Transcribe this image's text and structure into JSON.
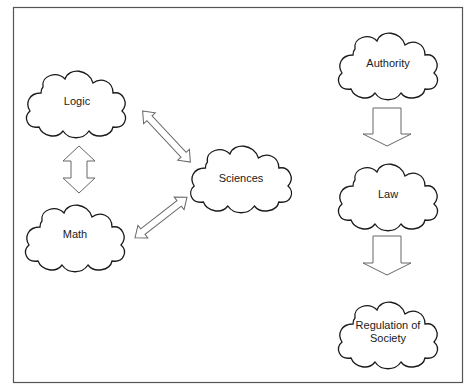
{
  "diagram": {
    "frame": {
      "x": 13,
      "y": 7,
      "width": 449,
      "height": 375,
      "stroke": "#555555"
    },
    "colors": {
      "cloud_stroke": "#1a1a1a",
      "arrow_stroke": "#666666",
      "fill": "#ffffff",
      "text": "#1a1a1a"
    },
    "nodes": [
      {
        "id": "logic",
        "label": "Logic",
        "cx": 76,
        "cy": 101,
        "w": 110,
        "h": 77
      },
      {
        "id": "math",
        "label": "Math",
        "cx": 75,
        "cy": 235,
        "w": 110,
        "h": 76
      },
      {
        "id": "sciences",
        "label": "Sciences",
        "cx": 241,
        "cy": 176,
        "w": 112,
        "h": 76
      },
      {
        "id": "authority",
        "label": "Authority",
        "cx": 388,
        "cy": 63,
        "w": 110,
        "h": 76
      },
      {
        "id": "law",
        "label": "Law",
        "cx": 388,
        "cy": 194,
        "w": 110,
        "h": 77
      },
      {
        "id": "regulation",
        "label_lines": [
          "Regulation of",
          "Society"
        ],
        "cx": 388,
        "cy": 332,
        "w": 110,
        "h": 76
      }
    ],
    "edges": [
      {
        "from": "logic",
        "to": "math",
        "type": "double-arrow",
        "direction": "vertical"
      },
      {
        "from": "logic",
        "to": "sciences",
        "type": "double-arrow",
        "direction": "diagonal"
      },
      {
        "from": "math",
        "to": "sciences",
        "type": "double-arrow",
        "direction": "diagonal"
      },
      {
        "from": "authority",
        "to": "law",
        "type": "block-arrow-down"
      },
      {
        "from": "law",
        "to": "regulation",
        "type": "block-arrow-down"
      }
    ]
  }
}
